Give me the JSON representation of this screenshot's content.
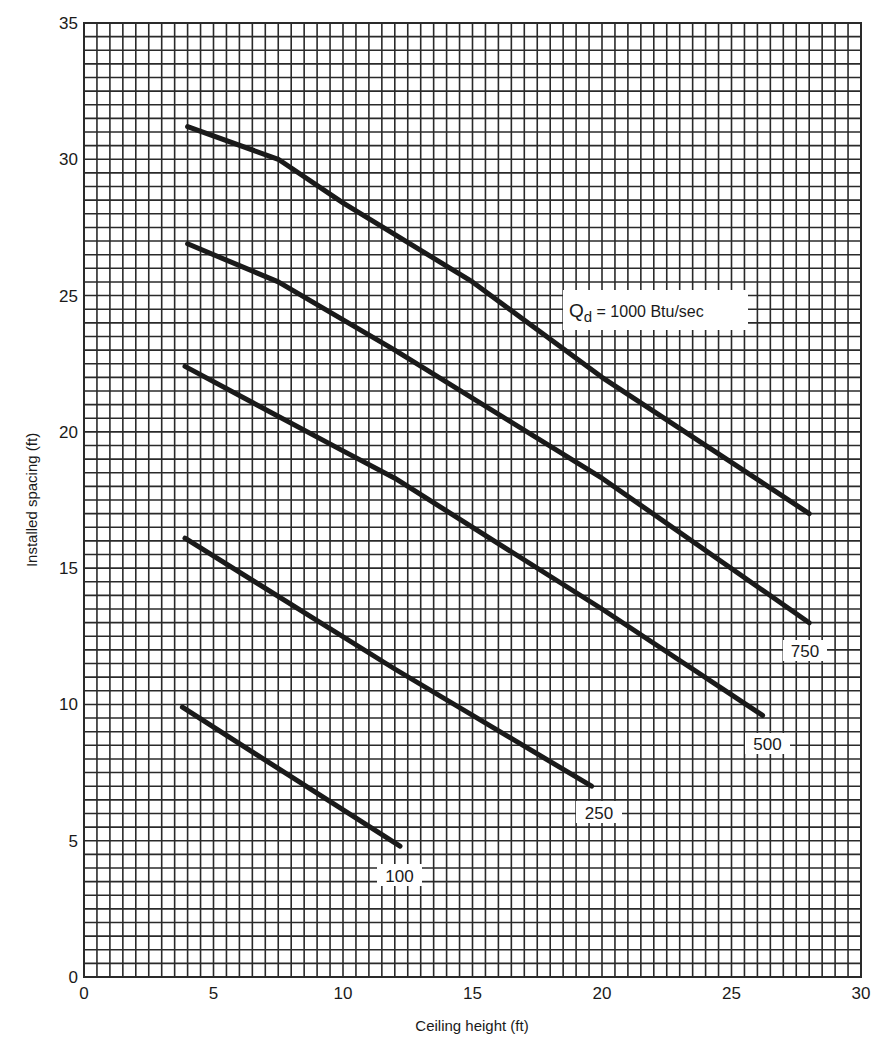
{
  "chart_data": {
    "type": "line",
    "title": "",
    "xlabel": "Ceiling height (ft)",
    "ylabel": "Installed spacing (ft)",
    "xlim": [
      0,
      30
    ],
    "ylim": [
      0,
      35
    ],
    "x_ticks": [
      0,
      5,
      10,
      15,
      20,
      25,
      30
    ],
    "y_ticks": [
      0,
      5,
      10,
      15,
      20,
      25,
      30,
      35
    ],
    "x_tick_labels": [
      "0",
      "5",
      "10",
      "15",
      "20",
      "25",
      "30"
    ],
    "y_tick_labels": [
      "0",
      "5",
      "10",
      "15",
      "20",
      "25",
      "30",
      "35"
    ],
    "grid": true,
    "grid_step": 0.5,
    "legend": "inline labels",
    "series": [
      {
        "name": "Qd = 1000 Btu/sec",
        "label": "1000",
        "points": [
          [
            4.0,
            31.2
          ],
          [
            7.5,
            30.0
          ],
          [
            10.0,
            28.4
          ],
          [
            15.0,
            25.5
          ],
          [
            20.0,
            22.0
          ],
          [
            28.0,
            17.0
          ]
        ]
      },
      {
        "name": "750",
        "label": "750",
        "points": [
          [
            4.0,
            26.9
          ],
          [
            7.5,
            25.5
          ],
          [
            12.0,
            23.0
          ],
          [
            20.0,
            18.3
          ],
          [
            28.0,
            13.0
          ]
        ]
      },
      {
        "name": "500",
        "label": "500",
        "points": [
          [
            3.9,
            22.4
          ],
          [
            10.0,
            19.3
          ],
          [
            12.0,
            18.3
          ],
          [
            20.0,
            13.5
          ],
          [
            26.2,
            9.6
          ]
        ]
      },
      {
        "name": "250",
        "label": "250",
        "points": [
          [
            3.9,
            16.1
          ],
          [
            12.0,
            11.3
          ],
          [
            19.6,
            7.0
          ]
        ]
      },
      {
        "name": "100",
        "label": "100",
        "points": [
          [
            3.8,
            9.9
          ],
          [
            12.2,
            4.8
          ]
        ]
      }
    ],
    "annotations": [
      {
        "text_main": "Q",
        "text_sub": "d",
        "text_rest": " = 1000 Btu/sec",
        "box": [
          563,
          290,
          185,
          40
        ]
      },
      {
        "text": "750",
        "box": [
          783,
          640,
          44,
          21
        ]
      },
      {
        "text": "500",
        "box": [
          745,
          733,
          45,
          21
        ]
      },
      {
        "text": "250",
        "box": [
          576,
          801,
          46,
          22
        ]
      },
      {
        "text": "100",
        "box": [
          377,
          864,
          45,
          22
        ]
      }
    ]
  },
  "layout": {
    "plot": {
      "left": 84,
      "top": 23,
      "right": 861,
      "bottom": 977
    },
    "line_color": "#1a1a1a",
    "grid_color": "#2a2a2a",
    "background": "#ffffff"
  }
}
